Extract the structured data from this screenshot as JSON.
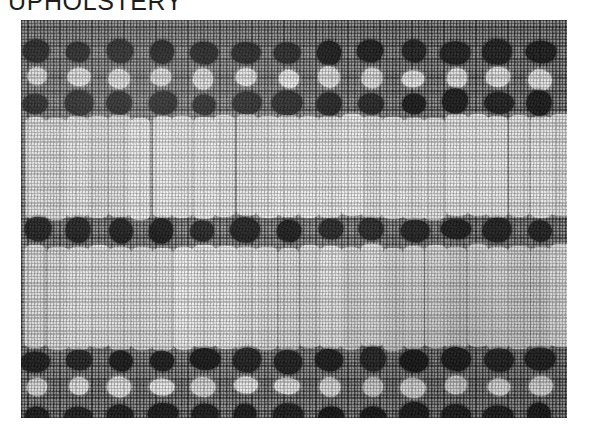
{
  "page": {
    "title": "UPHOLSTERY",
    "background_color": "#ffffff"
  },
  "photo": {
    "name": "upholstery-fabric-swatch",
    "alt": "UPHOLSTERY",
    "kind": "black-and-white photograph of woven upholstery fabric",
    "frame": {
      "left": 21,
      "top": 20,
      "width": 546,
      "height": 398
    },
    "colors": {
      "cloth_gray": "#8f8f8f",
      "dark_motif": "#1a1a1a",
      "light_motif": "#f2f2ee",
      "weave_thread_dark": "#3a3a3a",
      "weave_thread_light": "#e2e2e2"
    },
    "pattern": {
      "description": "Horizontal bands of dark square dots alternating with white dots, separated by panels of tall white vertical bars, all over a fine gray basket weave.",
      "column_pitch": 42,
      "column_start": 15,
      "column_count": 13,
      "dot_rows": [
        {
          "id": "dark-row-top-1",
          "y": 32,
          "tone": "dark",
          "offset": 0
        },
        {
          "id": "light-row-top",
          "y": 58,
          "tone": "light",
          "offset": 0
        },
        {
          "id": "dark-row-top-2",
          "y": 83,
          "tone": "dark",
          "offset": 0
        },
        {
          "id": "dark-row-middle",
          "y": 210,
          "tone": "dark",
          "offset": 0
        },
        {
          "id": "dark-row-bottom-1",
          "y": 340,
          "tone": "dark",
          "offset": 0
        },
        {
          "id": "light-row-bottom",
          "y": 366,
          "tone": "light",
          "offset": 0
        },
        {
          "id": "dark-row-bottom-2",
          "y": 396,
          "tone": "dark",
          "offset": 0
        }
      ],
      "bar_panels": [
        {
          "id": "bar-panel-upper",
          "top": 96,
          "height": 98,
          "bar_pitch": 21,
          "bar_width": 21,
          "bar_start": 15
        },
        {
          "id": "bar-panel-lower",
          "top": 226,
          "height": 99,
          "bar_pitch": 21,
          "bar_width": 21,
          "bar_start": 15
        }
      ]
    }
  }
}
